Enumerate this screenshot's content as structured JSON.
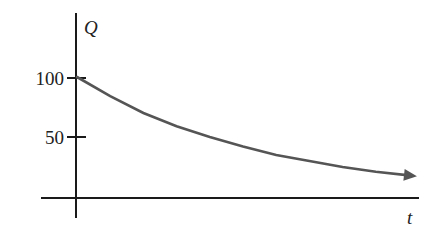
{
  "chart_data": {
    "type": "line",
    "title": "",
    "xlabel": "t",
    "ylabel": "Q",
    "x_ticks": [],
    "y_ticks": [
      50,
      100
    ],
    "ylim": [
      0,
      115
    ],
    "xlim": [
      0,
      10
    ],
    "grid": false,
    "legend": null,
    "series": [
      {
        "name": "Q(t)",
        "description": "exponential decay starting at 100, arrow at end",
        "x": [
          0,
          1,
          2,
          3,
          4,
          5,
          6,
          7,
          8,
          9,
          10
        ],
        "values": [
          100,
          84,
          70,
          59,
          50,
          42,
          35,
          30,
          25,
          21,
          18
        ]
      }
    ],
    "colors": {
      "axis": "#1a1a1a",
      "curve": "#555555"
    }
  },
  "labels": {
    "y_axis": "Q",
    "x_axis": "t",
    "tick_100": "100",
    "tick_50": "50"
  }
}
